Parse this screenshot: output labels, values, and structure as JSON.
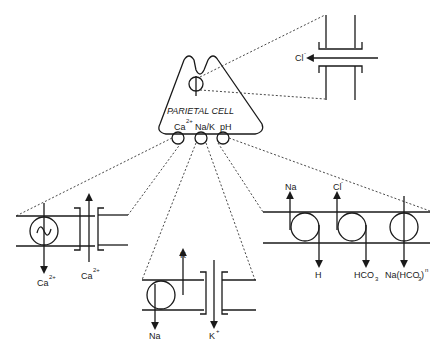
{
  "diagram": {
    "cell": {
      "title": "PARIETAL CELL",
      "ports": [
        {
          "label": "Ca",
          "sup": "2+"
        },
        {
          "label": "Na/K",
          "sup": ""
        },
        {
          "label": "pH",
          "sup": ""
        }
      ]
    },
    "chloride_channel": {
      "ion": "Cl",
      "ion_sup": "-"
    },
    "calcium_panel": {
      "exchanger_out": {
        "label": "Ca",
        "sup": "2+"
      },
      "channel_in": {
        "label": "Ca",
        "sup": "2+"
      }
    },
    "nak_panel": {
      "pump_up": {
        "label": "K"
      },
      "pump_down": {
        "label": "Na"
      },
      "channel": {
        "label": "K",
        "sup": "+"
      }
    },
    "ph_panel": {
      "exchanger1_up": {
        "label": "Na"
      },
      "exchanger1_down": {
        "label": "H"
      },
      "exchanger2_up": {
        "label": "Cl",
        "sup": "-"
      },
      "exchanger2_down": {
        "label": "HCO",
        "sub": "3"
      },
      "cotransporter": {
        "label": "Na(HCO",
        "sub": "3",
        "tail": ")",
        "sup": "n"
      }
    }
  },
  "colors": {
    "line": "#1a1a1a",
    "background": "#ffffff"
  }
}
